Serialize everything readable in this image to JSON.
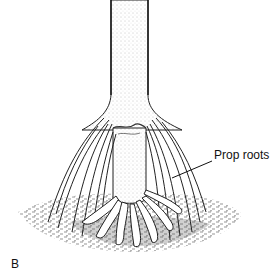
{
  "figure": {
    "callout_label": "Prop roots",
    "panel_letter": "B",
    "colors": {
      "ink": "#111111",
      "background": "#ffffff",
      "stipple": "#9a9a9a"
    }
  }
}
